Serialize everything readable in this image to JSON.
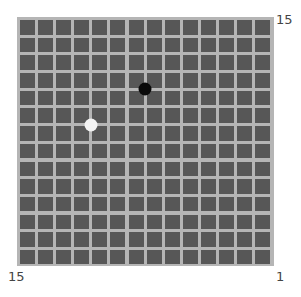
{
  "board": {
    "size": 15,
    "cell_color": "#575757",
    "line_color": "#b5b5b5",
    "stones": [
      {
        "color": "black",
        "col": 7,
        "row": 4
      },
      {
        "color": "white",
        "col": 4,
        "row": 6
      }
    ]
  },
  "labels": {
    "top_right": "15",
    "bottom_left": "15",
    "bottom_right": "1"
  }
}
